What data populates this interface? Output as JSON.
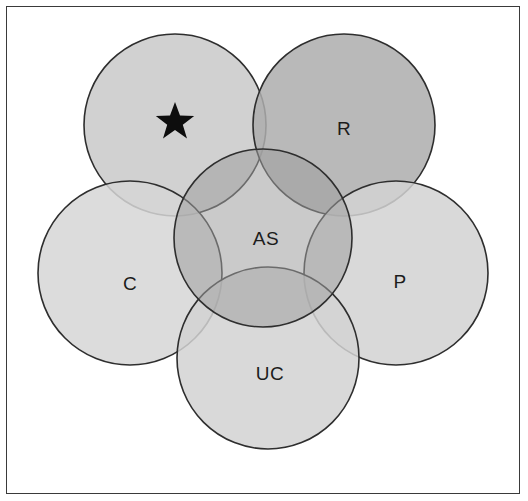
{
  "figure": {
    "background_color": "#ffffff",
    "frame_color": "#3a3a3a"
  },
  "diagram": {
    "type": "venn",
    "outline_color": "#2e2e2e",
    "outline_width": 1.6,
    "circles": [
      {
        "id": "star",
        "label": "",
        "marker": "star",
        "center_x": 175,
        "center_y": 125,
        "radius": 91,
        "fill": "#c9c9c9",
        "opacity": 0.85,
        "label_x": 175,
        "label_y": 125
      },
      {
        "id": "R",
        "label": "R",
        "marker": "",
        "center_x": 344,
        "center_y": 125,
        "radius": 91,
        "fill": "#adadad",
        "opacity": 0.85,
        "label_x": 344,
        "label_y": 130
      },
      {
        "id": "C",
        "label": "C",
        "marker": "",
        "center_x": 130,
        "center_y": 273,
        "radius": 92,
        "fill": "#d6d6d6",
        "opacity": 0.85,
        "label_x": 130,
        "label_y": 285
      },
      {
        "id": "P",
        "label": "P",
        "marker": "",
        "center_x": 396,
        "center_y": 273,
        "radius": 92,
        "fill": "#d2d2d2",
        "opacity": 0.85,
        "label_x": 400,
        "label_y": 283
      },
      {
        "id": "UC",
        "label": "UC",
        "marker": "",
        "center_x": 268,
        "center_y": 358,
        "radius": 91,
        "fill": "#d2d2d2",
        "opacity": 0.85,
        "label_x": 270,
        "label_y": 375
      },
      {
        "id": "AS",
        "label": "AS",
        "marker": "",
        "center_x": 263,
        "center_y": 238,
        "radius": 89,
        "fill": "#b6b6b6",
        "opacity": 0.55,
        "label_x": 266,
        "label_y": 240
      }
    ],
    "labels": [
      {
        "id": "star-marker",
        "text": "★",
        "x": 177,
        "y": 124
      },
      {
        "id": "R-label",
        "text": "R",
        "x": 344,
        "y": 130
      },
      {
        "id": "C-label",
        "text": "C",
        "x": 130,
        "y": 285
      },
      {
        "id": "P-label",
        "text": "P",
        "x": 400,
        "y": 283
      },
      {
        "id": "UC-label",
        "text": "UC",
        "x": 270,
        "y": 375
      },
      {
        "id": "AS-label",
        "text": "AS",
        "x": 266,
        "y": 240
      }
    ],
    "legend_keys": {
      "R": "R",
      "C": "C",
      "P": "P",
      "UC": "UC",
      "AS": "AS",
      "star": "★"
    }
  }
}
